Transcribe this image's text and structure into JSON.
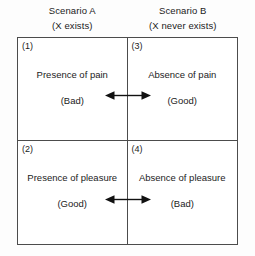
{
  "diagram": {
    "title_present": false,
    "columns": [
      {
        "id": "scenario-a",
        "line1": "Scenario A",
        "line2": "(X exists)"
      },
      {
        "id": "scenario-b",
        "line1": "Scenario B",
        "line2": "(X never exists)"
      }
    ],
    "cells": [
      {
        "number": "(1)",
        "main": "Presence of pain",
        "eval": "(Bad)"
      },
      {
        "number": "(3)",
        "main": "Absence of pain",
        "eval": "(Good)"
      },
      {
        "number": "(2)",
        "main": "Presence of pleasure",
        "eval": "(Good)"
      },
      {
        "number": "(4)",
        "main": "Absence of pleasure",
        "eval": "(Bad)"
      }
    ],
    "connectors": [
      {
        "id": "arrow-top",
        "type": "double-headed-arrow",
        "links": [
          "(1)",
          "(3)"
        ]
      },
      {
        "id": "arrow-bottom",
        "type": "double-headed-arrow",
        "links": [
          "(2)",
          "(4)"
        ]
      }
    ],
    "colors": {
      "border": "#4c4c4c",
      "text": "#1b1b1b",
      "background": "#fdfdfd",
      "cell_background": "#ffffff",
      "arrow": "#111111"
    }
  }
}
